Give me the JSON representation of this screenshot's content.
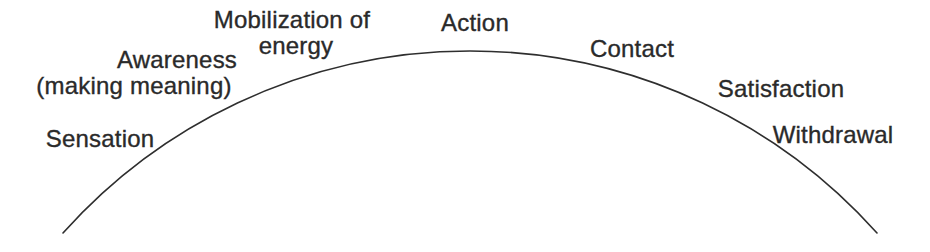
{
  "diagram": {
    "background_color": "#ffffff",
    "text_color": "#2a2a2a",
    "curve": {
      "color": "#2e2e2e",
      "stroke_width": 1.6,
      "path": "M 63 233 A 546 546 0 0 1 877 233"
    },
    "stages": [
      {
        "id": "sensation",
        "lines": [
          "Sensation"
        ]
      },
      {
        "id": "awareness",
        "lines": [
          "Awareness",
          "(making meaning)"
        ]
      },
      {
        "id": "mobilization-of-energy",
        "lines": [
          "Mobilization of",
          "energy"
        ]
      },
      {
        "id": "action",
        "lines": [
          "Action"
        ]
      },
      {
        "id": "contact",
        "lines": [
          "Contact"
        ]
      },
      {
        "id": "satisfaction",
        "lines": [
          "Satisfaction"
        ]
      },
      {
        "id": "withdrawal",
        "lines": [
          "Withdrawal"
        ]
      }
    ]
  }
}
